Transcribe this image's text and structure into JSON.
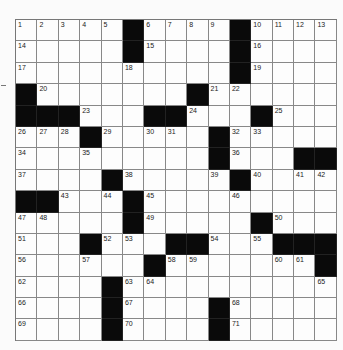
{
  "puzzle": {
    "rows": 15,
    "cols": 15,
    "grid": [
      [
        "1",
        "2",
        "3",
        "4",
        "5",
        "#",
        "6",
        "7",
        "8",
        "9",
        "#",
        "10",
        "11",
        "12",
        "13"
      ],
      [
        "14",
        "",
        "",
        "",
        "",
        "#",
        "15",
        "",
        "",
        "",
        "#",
        "16",
        "",
        "",
        ""
      ],
      [
        "17",
        "",
        "",
        "",
        "",
        "18",
        "",
        "",
        "",
        "",
        "#",
        "19",
        "",
        "",
        ""
      ],
      [
        "#",
        "20",
        "",
        "",
        "",
        "",
        "",
        "",
        "#",
        "21",
        "22",
        "",
        "",
        "",
        ""
      ],
      [
        "#",
        "#",
        "#",
        "23",
        "",
        "",
        "#",
        "#",
        "24",
        "",
        "",
        "#",
        "25",
        "",
        ""
      ],
      [
        "26",
        "27",
        "28",
        "#",
        "29",
        "",
        "30",
        "31",
        "",
        "#",
        "32",
        "33",
        "",
        "",
        ""
      ],
      [
        "34",
        "",
        "",
        "35",
        "",
        "",
        "",
        "",
        "",
        "#",
        "36",
        "",
        "",
        "#",
        "#"
      ],
      [
        "37",
        "",
        "",
        "",
        "#",
        "38",
        "",
        "",
        "",
        "39",
        "#",
        "40",
        "",
        "41",
        "42"
      ],
      [
        "#",
        "#",
        "43",
        "",
        "44",
        "#",
        "45",
        "",
        "",
        "",
        "46",
        "",
        "",
        "",
        ""
      ],
      [
        "47",
        "48",
        "",
        "",
        "",
        "#",
        "49",
        "",
        "",
        "",
        "",
        "#",
        "50",
        "",
        ""
      ],
      [
        "51",
        "",
        "",
        "#",
        "52",
        "53",
        "",
        "#",
        "#",
        "54",
        "",
        "55",
        "#",
        "#",
        "#"
      ],
      [
        "56",
        "",
        "",
        "57",
        "",
        "",
        "#",
        "58",
        "59",
        "",
        "",
        "",
        "60",
        "61",
        "#"
      ],
      [
        "62",
        "",
        "",
        "",
        "#",
        "63",
        "64",
        "",
        "",
        "",
        "",
        "",
        "",
        "",
        "65"
      ],
      [
        "66",
        "",
        "",
        "",
        "#",
        "67",
        "",
        "",
        "",
        "#",
        "68",
        "",
        "",
        "",
        ""
      ],
      [
        "69",
        "",
        "",
        "",
        "#",
        "70",
        "",
        "",
        "",
        "#",
        "71",
        "",
        "",
        "",
        ""
      ]
    ]
  },
  "colors": {
    "black_square": "#0a0a0a",
    "grid_line": "#888888",
    "cell_bg": "#fdfdfd"
  }
}
